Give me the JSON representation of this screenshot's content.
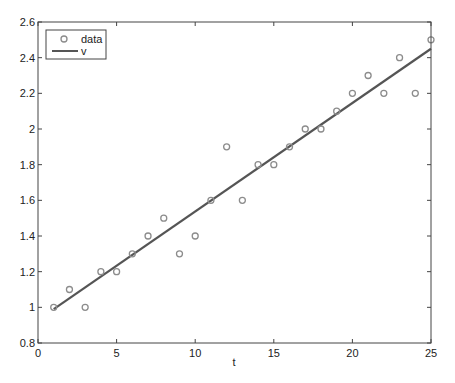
{
  "chart_data": {
    "type": "scatter",
    "title": "",
    "xlabel": "t",
    "ylabel": "",
    "xlim": [
      0,
      25
    ],
    "ylim": [
      0.8,
      2.6
    ],
    "grid": false,
    "legend_position": "upper-left",
    "x_ticks": [
      0,
      5,
      10,
      15,
      20,
      25
    ],
    "x_tick_labels": [
      "0",
      "5",
      "10",
      "15",
      "20",
      "25"
    ],
    "y_ticks": [
      0.8,
      1.0,
      1.2,
      1.4,
      1.6,
      1.8,
      2.0,
      2.2,
      2.4,
      2.6
    ],
    "y_tick_labels": [
      "0.8",
      "1",
      "1.2",
      "1.4",
      "1.6",
      "1.8",
      "2",
      "2.2",
      "2.4",
      "2.6"
    ],
    "series": [
      {
        "name": "data",
        "type": "scatter",
        "marker": "circle-open",
        "color": "#8c8c8c",
        "x": [
          1,
          2,
          3,
          4,
          5,
          6,
          7,
          8,
          9,
          10,
          11,
          12,
          13,
          14,
          15,
          16,
          17,
          18,
          19,
          20,
          21,
          22,
          23,
          24,
          25
        ],
        "y": [
          1.0,
          1.1,
          1.0,
          1.2,
          1.2,
          1.3,
          1.4,
          1.5,
          1.3,
          1.4,
          1.6,
          1.9,
          1.6,
          1.8,
          1.8,
          1.9,
          2.0,
          2.0,
          2.1,
          2.2,
          2.3,
          2.2,
          2.4,
          2.2,
          2.5
        ]
      },
      {
        "name": "v",
        "type": "line",
        "color": "#555555",
        "x": [
          1,
          25
        ],
        "y": [
          0.99,
          2.45
        ]
      }
    ]
  },
  "legend": {
    "items": [
      {
        "label": "data"
      },
      {
        "label": "v"
      }
    ]
  },
  "colors": {
    "axis": "#444444",
    "marker": "#8c8c8c",
    "line": "#555555"
  }
}
